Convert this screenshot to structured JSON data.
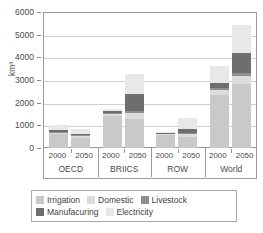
{
  "chart_data": {
    "type": "bar",
    "stacked": true,
    "title": "",
    "xlabel": "",
    "ylabel": "km³",
    "ylim": [
      0,
      6000
    ],
    "ytick_values": [
      0,
      1000,
      2000,
      3000,
      4000,
      5000,
      6000
    ],
    "ytick_labels": [
      "0",
      "1000",
      "2000",
      "3000",
      "4000",
      "5000",
      "6000"
    ],
    "grid": true,
    "legend_position": "bottom",
    "groups": [
      "OECD",
      "BRIICS",
      "ROW",
      "World"
    ],
    "years": [
      "2000",
      "2050"
    ],
    "categories": [
      "OECD 2000",
      "OECD 2050",
      "BRIICS 2000",
      "BRIICS 2050",
      "ROW 2000",
      "ROW 2050",
      "World 2000",
      "World 2050"
    ],
    "series": [
      {
        "name": "Irrigation",
        "color": "#c9c9c9",
        "values": [
          610,
          450,
          1430,
          1290,
          560,
          480,
          2330,
          2820
        ]
      },
      {
        "name": "Domestic",
        "color": "#dcdcdc",
        "values": [
          60,
          90,
          60,
          270,
          50,
          130,
          230,
          340
        ]
      },
      {
        "name": "Livestock",
        "color": "#8f8f8f",
        "values": [
          40,
          40,
          60,
          60,
          30,
          50,
          110,
          140
        ]
      },
      {
        "name": "Manufacuring",
        "color": "#6e6e6e",
        "values": [
          90,
          60,
          70,
          760,
          30,
          170,
          190,
          900
        ]
      },
      {
        "name": "Electricity",
        "color": "#e8e8e8",
        "values": [
          210,
          210,
          110,
          890,
          30,
          500,
          740,
          1230
        ]
      }
    ],
    "totals": [
      1010,
      850,
      1730,
      3270,
      700,
      1330,
      3600,
      5430
    ]
  },
  "axis": {
    "y_title": "km³"
  },
  "legend": {
    "rows": [
      [
        {
          "label": "Irrigation",
          "color": "#c9c9c9"
        },
        {
          "label": "Domestic",
          "color": "#dcdcdc"
        },
        {
          "label": "Livestock",
          "color": "#8f8f8f"
        }
      ],
      [
        {
          "label": "Manufacuring",
          "color": "#6e6e6e"
        },
        {
          "label": "Electricity",
          "color": "#e8e8e8"
        }
      ]
    ]
  }
}
